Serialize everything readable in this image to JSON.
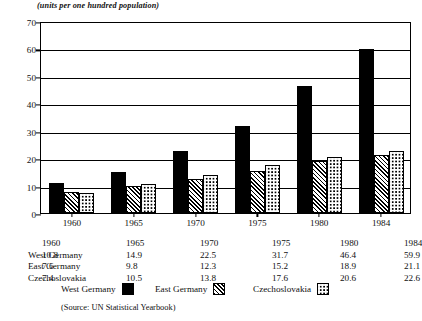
{
  "caption": "(units per one hundred population)",
  "source_note": "(Source: UN Statistical Yearbook)",
  "chart_data": {
    "type": "bar",
    "title": "(units per one hundred population)",
    "xlabel": "",
    "ylabel": "",
    "ylim": [
      0,
      70
    ],
    "ytick_step": 10,
    "yticks": [
      0,
      10,
      20,
      30,
      40,
      50,
      60,
      70
    ],
    "grid": true,
    "legend_position": "bottom",
    "categories": [
      "1960",
      "1965",
      "1970",
      "1975",
      "1980",
      "1984"
    ],
    "series": [
      {
        "name": "West Germany",
        "pattern": "solid-black",
        "values": [
          10.8,
          14.9,
          22.5,
          31.7,
          46.4,
          59.9
        ]
      },
      {
        "name": "East Germany",
        "pattern": "diagonal-hatch",
        "values": [
          7.6,
          9.8,
          12.3,
          15.2,
          18.9,
          21.1
        ]
      },
      {
        "name": "Czechoslovakia",
        "pattern": "dotted",
        "values": [
          7.4,
          10.5,
          13.8,
          17.6,
          20.6,
          22.6
        ]
      }
    ]
  },
  "table": {
    "col_headers": [
      "1960",
      "1965",
      "1970",
      "1975",
      "1980",
      "1984"
    ],
    "rows": [
      {
        "label": "West Germany",
        "values": [
          "10.8",
          "14.9",
          "22.5",
          "31.7",
          "46.4",
          "59.9"
        ]
      },
      {
        "label": "East Germany",
        "values": [
          "7.6",
          "9.8",
          "12.3",
          "15.2",
          "18.9",
          "21.1"
        ]
      },
      {
        "label": "Czechoslovakia",
        "values": [
          "7.4",
          "10.5",
          "13.8",
          "17.6",
          "20.6",
          "22.6"
        ]
      }
    ]
  },
  "legend": {
    "entries": [
      {
        "label": "West Germany",
        "pattern": "solid-black"
      },
      {
        "label": "East Germany",
        "pattern": "diagonal-hatch"
      },
      {
        "label": "Czechoslovakia",
        "pattern": "dotted"
      }
    ]
  }
}
